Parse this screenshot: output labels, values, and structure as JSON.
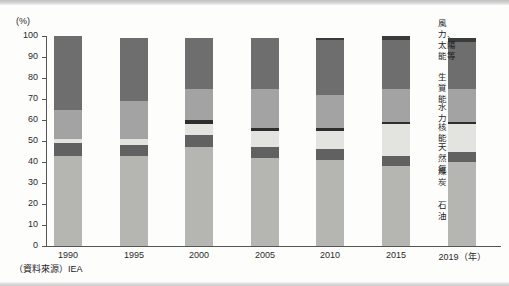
{
  "axis": {
    "unit_label": "(%)",
    "y_ticks": [
      "100",
      "90",
      "80",
      "70",
      "60",
      "50",
      "40",
      "30",
      "20",
      "10",
      "0"
    ],
    "x_ticks": [
      "1990",
      "1995",
      "2000",
      "2005",
      "2010",
      "2015",
      "2019（年）"
    ]
  },
  "source": {
    "text": "（資料來源）IEA"
  },
  "legend": {
    "items": [
      {
        "label": "風力、\n太陽能等",
        "color": "#3b3b3b"
      },
      {
        "label": "生質能",
        "color": "#6e6e6e"
      },
      {
        "label": "水力",
        "color": "#a3a3a3"
      },
      {
        "label": "核能",
        "color": "#2e2e2e"
      },
      {
        "label": "天然氣",
        "color": "#e3e3e0"
      },
      {
        "label": "煤炭",
        "color": "#616161"
      },
      {
        "label": "石油",
        "color": "#b5b5b2"
      }
    ]
  },
  "chart_data": {
    "type": "bar",
    "subtype": "stacked-100-percent",
    "title": "",
    "xlabel": "年",
    "ylabel": "(%)",
    "ylim": [
      0,
      100
    ],
    "grid": false,
    "legend_position": "right",
    "categories": [
      "1990",
      "1995",
      "2000",
      "2005",
      "2010",
      "2015",
      "2019"
    ],
    "series": [
      {
        "name": "石油",
        "color": "#b5b5b2",
        "values": [
          43,
          43,
          47,
          42,
          41,
          38,
          40
        ]
      },
      {
        "name": "煤炭",
        "color": "#616161",
        "values": [
          6,
          5,
          6,
          5,
          5,
          5,
          5
        ]
      },
      {
        "name": "天然氣",
        "color": "#e3e3e0",
        "values": [
          2,
          3,
          5,
          8,
          9,
          15,
          13
        ]
      },
      {
        "name": "核能",
        "color": "#2e2e2e",
        "values": [
          0,
          0,
          2,
          1,
          1,
          1,
          1
        ]
      },
      {
        "name": "水力",
        "color": "#a3a3a3",
        "values": [
          14,
          18,
          15,
          19,
          16,
          16,
          16
        ]
      },
      {
        "name": "生質能",
        "color": "#6e6e6e",
        "values": [
          35,
          30,
          24,
          24,
          26,
          23,
          22
        ]
      },
      {
        "name": "風力、太陽能等",
        "color": "#3b3b3b",
        "values": [
          0,
          0,
          0,
          0,
          1,
          2,
          2
        ]
      }
    ],
    "totals": [
      100,
      99,
      99,
      99,
      99,
      100,
      99
    ]
  }
}
